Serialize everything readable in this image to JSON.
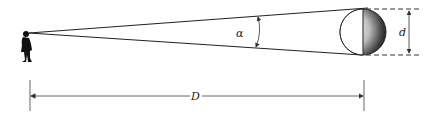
{
  "diagram": {
    "labels": {
      "angle": "α",
      "diameter": "d",
      "distance": "D"
    },
    "elements": {
      "observer": "person-silhouette",
      "object": "shaded-sphere"
    },
    "colors": {
      "line": "#222222",
      "dim_line": "#555555",
      "background": "#ffffff"
    }
  }
}
